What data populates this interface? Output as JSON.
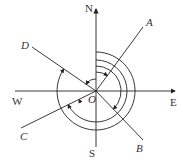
{
  "diagram": {
    "type": "compass-bearing-angles",
    "center": {
      "label": "O"
    },
    "directions": {
      "north": "N",
      "south": "S",
      "east": "E",
      "west": "W"
    },
    "rays": [
      {
        "label": "A",
        "quadrant": "NE"
      },
      {
        "label": "B",
        "quadrant": "SE"
      },
      {
        "label": "C",
        "quadrant": "SW"
      },
      {
        "label": "D",
        "quadrant": "NW"
      }
    ],
    "arcs": [
      {
        "from": "N",
        "to": "A",
        "direction": "clockwise"
      },
      {
        "from": "N",
        "to": "B",
        "direction": "clockwise"
      },
      {
        "from": "N",
        "to": "C",
        "direction": "clockwise"
      },
      {
        "from": "N",
        "to": "D",
        "direction": "clockwise"
      },
      {
        "from": "N",
        "to": "D",
        "direction": "counterclockwise"
      }
    ],
    "colors": {
      "stroke": "#222222",
      "text": "#333333"
    }
  }
}
